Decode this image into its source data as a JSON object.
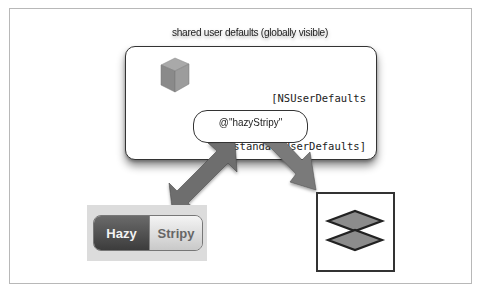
{
  "diagram": {
    "title": "shared user defaults (globally visible)",
    "store": {
      "icon": "cube-icon",
      "code_lines": [
        "[NSUserDefaults",
        "standardUserDefaults]"
      ]
    },
    "key": {
      "label": "@\"hazyStripy\""
    },
    "segmented_control": {
      "segments": [
        "Hazy",
        "Stripy"
      ],
      "selected": "Hazy"
    },
    "layers_view": {
      "icon": "stacked-diamonds-icon"
    },
    "connections": [
      {
        "from": "key",
        "to": "segmented_control",
        "type": "bidirectional-arrow"
      },
      {
        "from": "key",
        "to": "layers_view",
        "type": "one-way-arrow"
      }
    ],
    "colors": {
      "frame_border": "#b8b8b8",
      "box_border": "#333333",
      "arrow_fill": "#6e6e6e",
      "diamond_fill": "#8c8c8c",
      "segment_selected": "#4a4a4a",
      "segment_unselected": "#e2e2e2"
    }
  }
}
